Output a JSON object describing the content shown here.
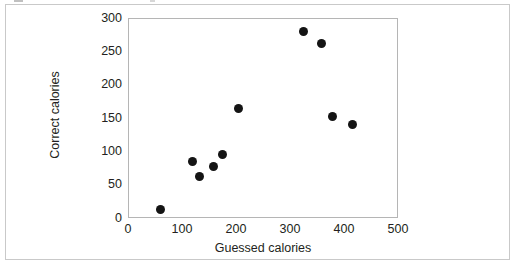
{
  "figure": {
    "background_color": "#ffffff",
    "frame_color": "#c9c9c9",
    "plot_border_color": "#b5b5b5",
    "marker_color": "#141414",
    "text_color": "#231f20"
  },
  "chart_data": {
    "type": "scatter",
    "title": "",
    "xlabel": "Guessed calories",
    "ylabel": "Correct calories",
    "xlim": [
      0,
      500
    ],
    "ylim": [
      0,
      300
    ],
    "xticks": [
      0,
      100,
      200,
      300,
      400,
      500
    ],
    "yticks": [
      0,
      50,
      100,
      150,
      200,
      250,
      300
    ],
    "xtick_labels": [
      "0",
      "100",
      "200",
      "300",
      "400",
      "500"
    ],
    "ytick_labels": [
      "0",
      "50",
      "100",
      "150",
      "200",
      "250",
      "300"
    ],
    "grid": false,
    "legend": false,
    "series": [
      {
        "name": "observations",
        "marker": "circle",
        "color": "#141414",
        "points": [
          {
            "x": 60,
            "y": 13
          },
          {
            "x": 120,
            "y": 85
          },
          {
            "x": 133,
            "y": 62
          },
          {
            "x": 159,
            "y": 78
          },
          {
            "x": 175,
            "y": 96
          },
          {
            "x": 205,
            "y": 165
          },
          {
            "x": 325,
            "y": 280
          },
          {
            "x": 358,
            "y": 262
          },
          {
            "x": 378,
            "y": 153
          },
          {
            "x": 415,
            "y": 141
          }
        ]
      }
    ]
  }
}
